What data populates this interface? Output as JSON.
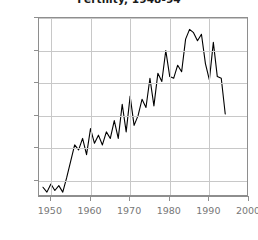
{
  "chart_data": {
    "type": "line",
    "title": "Fertility, 1948-94",
    "xlabel": "",
    "ylabel": "",
    "xlim": [
      1947,
      2000
    ],
    "ylim": [
      240,
      350
    ],
    "grid": true,
    "legend": "none",
    "line_color": "#000000",
    "grid_color": "#c8c8c8",
    "axis_color": "#8e8e8e",
    "tick_label_color": "#777777",
    "y_ticks": [
      250,
      270,
      290,
      310,
      330,
      350
    ],
    "x_ticks": [
      1950,
      1960,
      1970,
      1980,
      1990,
      2000
    ],
    "x_tick_labels": [
      "1950",
      "1960",
      "1970",
      "1980",
      "1990",
      "2000"
    ],
    "y_tick_labels": [
      "250",
      "270",
      "290",
      "310",
      "330",
      "350"
    ],
    "x": [
      1948,
      1949,
      1950,
      1951,
      1952,
      1953,
      1954,
      1955,
      1956,
      1957,
      1958,
      1959,
      1960,
      1961,
      1962,
      1963,
      1964,
      1965,
      1966,
      1967,
      1968,
      1969,
      1970,
      1971,
      1972,
      1973,
      1974,
      1975,
      1976,
      1977,
      1978,
      1979,
      1980,
      1981,
      1982,
      1983,
      1984,
      1985,
      1986,
      1987,
      1988,
      1989,
      1990,
      1991,
      1992,
      1993,
      1994
    ],
    "values": [
      246,
      243,
      248,
      244,
      247,
      243,
      252,
      262,
      272,
      269,
      276,
      266,
      282,
      273,
      278,
      272,
      280,
      276,
      287,
      276,
      297,
      280,
      302,
      284,
      290,
      300,
      295,
      313,
      296,
      316,
      311,
      330,
      314,
      313,
      321,
      317,
      337,
      343,
      341,
      336,
      340,
      322,
      312,
      335,
      314,
      313,
      291
    ],
    "series": [
      {
        "name": "Fertility",
        "values": [
          246,
          243,
          248,
          244,
          247,
          243,
          252,
          262,
          272,
          269,
          276,
          266,
          282,
          273,
          278,
          272,
          280,
          276,
          287,
          276,
          297,
          280,
          302,
          284,
          290,
          300,
          295,
          313,
          296,
          316,
          311,
          330,
          314,
          313,
          321,
          317,
          337,
          343,
          341,
          336,
          340,
          322,
          312,
          335,
          314,
          313,
          291
        ]
      }
    ],
    "annotations": []
  }
}
